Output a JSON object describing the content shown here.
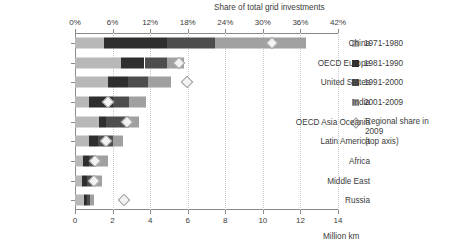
{
  "chart_data": {
    "type": "bar",
    "orientation": "horizontal",
    "stacked": true,
    "title": "",
    "top_axis": {
      "label": "Share of total grid investments",
      "ticks": [
        "0%",
        "6%",
        "12%",
        "18%",
        "24%",
        "30%",
        "36%",
        "42%"
      ],
      "tick_values": [
        0,
        6,
        12,
        18,
        24,
        30,
        36,
        42
      ],
      "lim": [
        0,
        42
      ],
      "grid": true
    },
    "bottom_axis": {
      "label": "Million km",
      "ticks": [
        "0",
        "2",
        "4",
        "6",
        "8",
        "10",
        "12",
        "14"
      ],
      "tick_values": [
        0,
        2,
        4,
        6,
        8,
        10,
        12,
        14
      ],
      "lim": [
        0,
        14
      ],
      "grid": true
    },
    "categories": [
      "China",
      "OECD Europe",
      "United States",
      "India",
      "OECD Asia Oceania",
      "Latin America",
      "Africa",
      "Middle East",
      "Russia"
    ],
    "series": [
      {
        "name": "1971-1980",
        "color": "#b8b8b8",
        "values": [
          1.55,
          2.45,
          1.75,
          0.75,
          1.3,
          0.75,
          0.4,
          0.35,
          0.5
        ]
      },
      {
        "name": "1981-1990",
        "color": "#2e2e2e",
        "values": [
          3.35,
          1.25,
          1.05,
          1.25,
          0.35,
          0.45,
          0.35,
          0.3,
          0.12
        ]
      },
      {
        "name": "1991-2000",
        "color": "#4d4d4d",
        "values": [
          2.55,
          1.2,
          1.1,
          0.85,
          1.2,
          0.8,
          0.35,
          0.25,
          0.2
        ]
      },
      {
        "name": "2001-2009",
        "color": "#a0a0a0",
        "values": [
          4.85,
          0.9,
          1.2,
          0.95,
          0.55,
          0.55,
          0.65,
          0.55,
          0.18
        ]
      }
    ],
    "totals": [
      12.3,
      5.8,
      5.1,
      3.8,
      3.4,
      2.55,
      1.75,
      1.45,
      1.0
    ],
    "marker_series": {
      "name": "Regional share in 2009",
      "note": "(top axis)",
      "axis": "top",
      "unit": "%",
      "color": "#f2f2f2",
      "edge_color": "#9a9a9a",
      "values": [
        31.5,
        16.6,
        17.9,
        5.2,
        8.3,
        5.0,
        3.2,
        3.0,
        7.8
      ]
    }
  },
  "legend": {
    "position": "right",
    "entries": [
      {
        "label": "1971-1980",
        "swatch": "legend-swatch-1971-1980"
      },
      {
        "label": "1981-1990",
        "swatch": "legend-swatch-1981-1990"
      },
      {
        "label": "1991-2000",
        "swatch": "legend-swatch-1991-2000"
      },
      {
        "label": "2001-2009",
        "swatch": "legend-swatch-2001-2009"
      }
    ],
    "marker_entry": {
      "label": "Regional share in 2009",
      "sub_label": "(top axis)",
      "icon": "diamond-marker-icon"
    }
  }
}
